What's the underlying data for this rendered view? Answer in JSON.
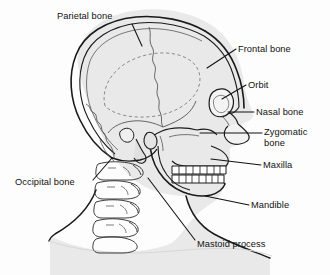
{
  "figure": {
    "type": "anatomical-diagram",
    "background_color": "#fdfdfd",
    "bone_fill_color": "#e8e8e8",
    "outline_color": "#1a1a1a",
    "suture_color": "#555555",
    "label_color": "#111111"
  },
  "labels": [
    {
      "id": "parietal-bone",
      "text": "Parietal bone",
      "x": 57,
      "y": 11,
      "align": "left",
      "lines": 1
    },
    {
      "id": "frontal-bone",
      "text": "Frontal bone",
      "x": 238,
      "y": 44,
      "align": "left",
      "lines": 1
    },
    {
      "id": "orbit",
      "text": "Orbit",
      "x": 248,
      "y": 80,
      "align": "left",
      "lines": 1
    },
    {
      "id": "nasal-bone",
      "text": "Nasal bone",
      "x": 256,
      "y": 107,
      "align": "left",
      "lines": 1
    },
    {
      "id": "zygomatic-bone",
      "text": "Zygomatic\nbone",
      "x": 264,
      "y": 127,
      "align": "left",
      "lines": 2
    },
    {
      "id": "maxilla",
      "text": "Maxilla",
      "x": 263,
      "y": 160,
      "align": "left",
      "lines": 1
    },
    {
      "id": "mandible",
      "text": "Mandible",
      "x": 251,
      "y": 200,
      "align": "left",
      "lines": 1
    },
    {
      "id": "mastoid-process",
      "text": "Mastoid process",
      "x": 197,
      "y": 239,
      "align": "left",
      "lines": 1
    },
    {
      "id": "occipital-bone",
      "text": "Occipital bone",
      "x": 15,
      "y": 177,
      "align": "left",
      "lines": 1
    }
  ],
  "leader_lines": [
    {
      "id": "leader-parietal-bone",
      "x1": 132,
      "y1": 24,
      "x2": 142,
      "y2": 46
    },
    {
      "id": "leader-frontal-bone",
      "x1": 236,
      "y1": 49,
      "x2": 207,
      "y2": 68
    },
    {
      "id": "leader-orbit",
      "x1": 246,
      "y1": 85,
      "x2": 222,
      "y2": 99
    },
    {
      "id": "leader-nasal-bone",
      "x1": 254,
      "y1": 112,
      "x2": 228,
      "y2": 112
    },
    {
      "id": "leader-zygomatic-bone",
      "x1": 262,
      "y1": 133,
      "x2": 200,
      "y2": 133
    },
    {
      "id": "leader-maxilla",
      "x1": 261,
      "y1": 165,
      "x2": 211,
      "y2": 159
    },
    {
      "id": "leader-mandible",
      "x1": 249,
      "y1": 205,
      "x2": 205,
      "y2": 196
    },
    {
      "id": "leader-mastoid-process",
      "x1": 195,
      "y1": 240,
      "x2": 148,
      "y2": 178
    },
    {
      "id": "leader-occipital-bone",
      "x1": 93,
      "y1": 180,
      "x2": 112,
      "y2": 158
    }
  ],
  "anatomy_parts": [
    {
      "id": "cranium",
      "name": "Cranial vault"
    },
    {
      "id": "coronal-suture",
      "name": "Coronal suture"
    },
    {
      "id": "lambdoid-suture",
      "name": "Lambdoid suture"
    },
    {
      "id": "temporal-line",
      "name": "Temporal line (dashed)"
    },
    {
      "id": "orbit-socket",
      "name": "Orbit"
    },
    {
      "id": "nasal-aperture",
      "name": "Nasal aperture"
    },
    {
      "id": "zygomatic-arch",
      "name": "Zygomatic arch"
    },
    {
      "id": "upper-teeth",
      "name": "Upper dental arch"
    },
    {
      "id": "lower-teeth",
      "name": "Lower dental arch"
    },
    {
      "id": "mandible-body",
      "name": "Mandible"
    },
    {
      "id": "mastoid",
      "name": "Mastoid process"
    },
    {
      "id": "cervical-spine",
      "name": "Cervical vertebrae"
    },
    {
      "id": "soft-tissue",
      "name": "Head and neck silhouette"
    }
  ]
}
